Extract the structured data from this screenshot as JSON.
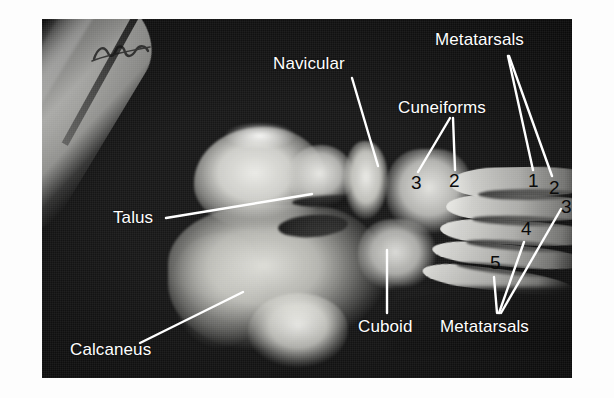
{
  "image": {
    "type": "radiograph",
    "subject": "lateral-oblique foot x-ray with anatomical annotations",
    "plate_background_color": "#171717",
    "page_background_color": "#ffffff",
    "label_color": "#ffffff",
    "number_color": "#0c0c0c",
    "leader_line_color": "#ffffff",
    "film_corner_marking": "illegible handwritten film marking"
  },
  "labels": [
    {
      "id": "navicular",
      "text": "Navicular"
    },
    {
      "id": "metatarsals_top",
      "text": "Metatarsals"
    },
    {
      "id": "cuneiforms",
      "text": "Cuneiforms"
    },
    {
      "id": "talus",
      "text": "Talus"
    },
    {
      "id": "cuboid",
      "text": "Cuboid"
    },
    {
      "id": "metatarsals_bottom",
      "text": "Metatarsals"
    },
    {
      "id": "calcaneus",
      "text": "Calcaneus"
    }
  ],
  "numbers": {
    "cuneiform_3": "3",
    "cuneiform_2": "2",
    "metatarsal_1": "1",
    "metatarsal_2": "2",
    "metatarsal_3": "3",
    "metatarsal_4": "4",
    "metatarsal_5": "5"
  },
  "groups": {
    "cuneiforms_pointed_to": [
      "3",
      "2"
    ],
    "metatarsals_top_pointed_to": [
      "1",
      "2"
    ],
    "metatarsals_bottom_pointed_to": [
      "5",
      "4",
      "3"
    ]
  }
}
